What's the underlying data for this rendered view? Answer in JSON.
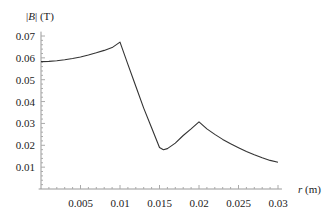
{
  "chart_data": {
    "type": "line",
    "title": "",
    "xlabel": "r (m)",
    "ylabel": "|B| (T)",
    "xlabel_var": "r",
    "xlabel_unit": "(m)",
    "ylabel_var": "B",
    "ylabel_unit": "(T)",
    "xlim": [
      0,
      0.03
    ],
    "ylim": [
      0,
      0.07
    ],
    "grid": false,
    "legend": null,
    "x_ticks": [
      0.005,
      0.01,
      0.015,
      0.02,
      0.025,
      0.03
    ],
    "x_tick_labels": [
      "0.005",
      "0.01",
      "0.015",
      "0.02",
      "0.025",
      "0.03"
    ],
    "y_ticks": [
      0.01,
      0.02,
      0.03,
      0.04,
      0.05,
      0.06,
      0.07
    ],
    "y_tick_labels": [
      "0.01",
      "0.02",
      "0.03",
      "0.04",
      "0.05",
      "0.06",
      "0.07"
    ],
    "series": [
      {
        "name": "|B|",
        "color": "#333333",
        "x": [
          0,
          0.001,
          0.002,
          0.003,
          0.004,
          0.005,
          0.006,
          0.007,
          0.008,
          0.009,
          0.01,
          0.011,
          0.012,
          0.013,
          0.014,
          0.015,
          0.0155,
          0.016,
          0.017,
          0.018,
          0.019,
          0.02,
          0.021,
          0.022,
          0.023,
          0.024,
          0.025,
          0.026,
          0.027,
          0.028,
          0.029,
          0.03
        ],
        "values": [
          0.0583,
          0.0584,
          0.0587,
          0.0591,
          0.0597,
          0.0604,
          0.0613,
          0.0623,
          0.0634,
          0.0647,
          0.0672,
          0.057,
          0.047,
          0.037,
          0.028,
          0.019,
          0.018,
          0.0185,
          0.021,
          0.0245,
          0.0275,
          0.0307,
          0.0275,
          0.025,
          0.0227,
          0.0207,
          0.0189,
          0.0172,
          0.0157,
          0.0143,
          0.0131,
          0.0122
        ]
      }
    ]
  }
}
